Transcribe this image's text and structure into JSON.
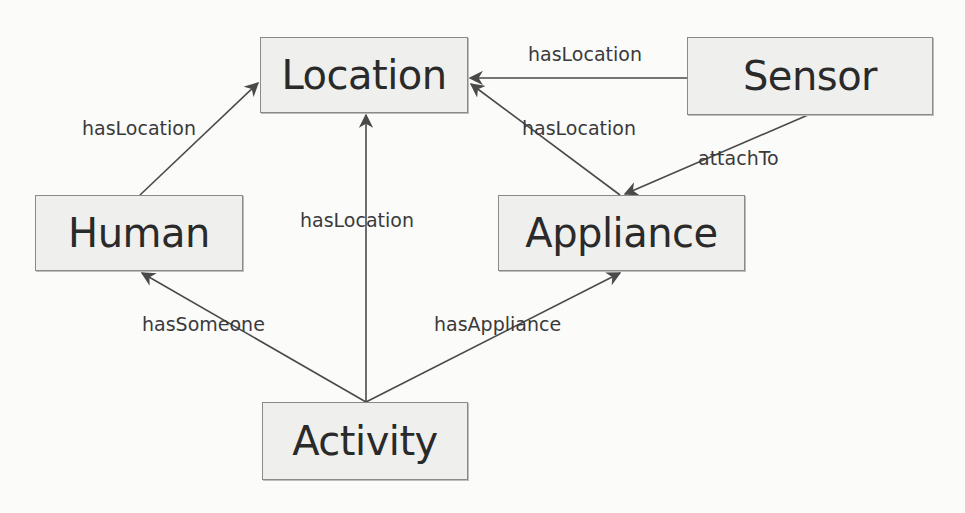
{
  "diagram": {
    "type": "ontology-graph",
    "colors": {
      "background": "#fbfbfa",
      "node_fill": "#efefed",
      "node_border": "#8a8a88",
      "edge": "#4a4a4a",
      "text": "#2a2a2a"
    },
    "nodes": [
      {
        "id": "location",
        "label": "Location",
        "x": 260,
        "y": 37,
        "w": 208,
        "h": 76
      },
      {
        "id": "sensor",
        "label": "Sensor",
        "x": 687,
        "y": 37,
        "w": 246,
        "h": 78
      },
      {
        "id": "human",
        "label": "Human",
        "x": 35,
        "y": 195,
        "w": 208,
        "h": 76
      },
      {
        "id": "appliance",
        "label": "Appliance",
        "x": 498,
        "y": 195,
        "w": 247,
        "h": 76
      },
      {
        "id": "activity",
        "label": "Activity",
        "x": 262,
        "y": 402,
        "w": 206,
        "h": 78
      }
    ],
    "edges": [
      {
        "id": "human-location",
        "from": "human",
        "to": "location",
        "label": "hasLocation"
      },
      {
        "id": "sensor-location",
        "from": "sensor",
        "to": "location",
        "label": "hasLocation"
      },
      {
        "id": "appliance-location",
        "from": "appliance",
        "to": "location",
        "label": "hasLocation"
      },
      {
        "id": "sensor-appliance",
        "from": "sensor",
        "to": "appliance",
        "label": "attachTo"
      },
      {
        "id": "activity-location",
        "from": "activity",
        "to": "location",
        "label": "hasLocation"
      },
      {
        "id": "activity-human",
        "from": "activity",
        "to": "human",
        "label": "hasSomeone"
      },
      {
        "id": "activity-appliance",
        "from": "activity",
        "to": "appliance",
        "label": "hasAppliance"
      }
    ]
  }
}
